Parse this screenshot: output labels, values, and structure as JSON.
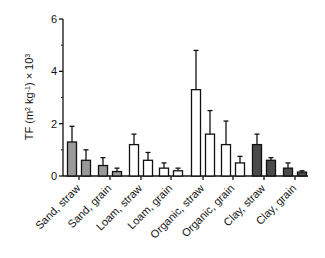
{
  "chart_data": {
    "type": "bar",
    "title": "",
    "xlabel": "",
    "ylabel": "TF (m² kg⁻¹) × 10³",
    "ylabel_parts": {
      "base": "TF (m",
      "sup1": "2",
      "mid": " kg",
      "sup2": "-1",
      "end": ") × 10",
      "sup3": "3"
    },
    "ylim": [
      0,
      6
    ],
    "yticks": [
      0,
      2,
      4,
      6
    ],
    "yminor_ticks": [
      1,
      3,
      5
    ],
    "grid": false,
    "legend": null,
    "categories": [
      "Sand, straw",
      "Sand, grain",
      "Loam, straw",
      "Loam, grain",
      "Organic, straw",
      "Organic, grain",
      "Clay, straw",
      "Clay, grain"
    ],
    "groups": [
      {
        "category": "Sand, straw",
        "color": "#999999",
        "bars": [
          {
            "value": 1.3,
            "error": 0.6
          },
          {
            "value": 0.6,
            "error": 0.4
          }
        ]
      },
      {
        "category": "Sand, grain",
        "color": "#999999",
        "bars": [
          {
            "value": 0.4,
            "error": 0.3
          },
          {
            "value": 0.17,
            "error": 0.13
          }
        ]
      },
      {
        "category": "Loam, straw",
        "color": "#ffffff",
        "bars": [
          {
            "value": 1.2,
            "error": 0.4
          },
          {
            "value": 0.6,
            "error": 0.3
          }
        ]
      },
      {
        "category": "Loam, grain",
        "color": "#ffffff",
        "bars": [
          {
            "value": 0.3,
            "error": 0.2
          },
          {
            "value": 0.2,
            "error": 0.1
          }
        ]
      },
      {
        "category": "Organic, straw",
        "color": "#ffffff",
        "bars": [
          {
            "value": 3.3,
            "error": 1.5
          },
          {
            "value": 1.6,
            "error": 0.9
          }
        ]
      },
      {
        "category": "Organic, grain",
        "color": "#ffffff",
        "bars": [
          {
            "value": 1.2,
            "error": 0.9
          },
          {
            "value": 0.5,
            "error": 0.25
          }
        ]
      },
      {
        "category": "Clay, straw",
        "color": "#4a4a4a",
        "bars": [
          {
            "value": 1.2,
            "error": 0.4
          },
          {
            "value": 0.6,
            "error": 0.1
          }
        ]
      },
      {
        "category": "Clay, grain",
        "color": "#4a4a4a",
        "bars": [
          {
            "value": 0.3,
            "error": 0.2
          },
          {
            "value": 0.15,
            "error": 0.05
          }
        ]
      }
    ]
  },
  "layout": {
    "axis_x": 63,
    "baseline_y": 176,
    "top_y": 19,
    "axis_end_x": 308,
    "tick_x": [
      79,
      110,
      141,
      171,
      203,
      233,
      264,
      295
    ],
    "bar_width": 9,
    "bar_gap": 3
  }
}
